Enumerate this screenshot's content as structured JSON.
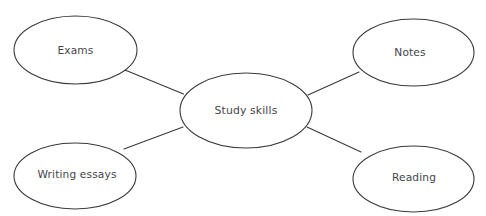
{
  "diagram": {
    "type": "mind-map",
    "background_color": "#ffffff",
    "stroke_color": "#3a3a3e",
    "text_color": "#45454a",
    "center_node": {
      "id": "study-skills",
      "label": "Study skills",
      "cx": 246,
      "cy": 110.5,
      "rx": 66,
      "ry": 37.5
    },
    "branch_nodes": [
      {
        "id": "exams",
        "label": "Exams",
        "cx": 75.5,
        "cy": 50,
        "rx": 61.5,
        "ry": 34
      },
      {
        "id": "notes",
        "label": "Notes",
        "cx": 413.5,
        "cy": 52.5,
        "rx": 60.5,
        "ry": 33.5
      },
      {
        "id": "writing-essays",
        "label": "Writing essays",
        "cx": 75,
        "cy": 176,
        "rx": 61,
        "ry": 33
      },
      {
        "id": "reading",
        "label": "Reading",
        "cx": 413.5,
        "cy": 179,
        "rx": 60.5,
        "ry": 33
      }
    ],
    "connectors": [
      {
        "id": "connector-exams",
        "from": "exams",
        "to": "study-skills",
        "x1": 125,
        "y1": 70,
        "x2": 183.5,
        "y2": 94
      },
      {
        "id": "connector-notes",
        "from": "notes",
        "to": "study-skills",
        "x1": 308,
        "y1": 95,
        "x2": 359,
        "y2": 72
      },
      {
        "id": "connector-writing-essays",
        "from": "writing-essays",
        "to": "study-skills",
        "x1": 124,
        "y1": 149,
        "x2": 183,
        "y2": 127
      },
      {
        "id": "connector-reading",
        "from": "reading",
        "to": "study-skills",
        "x1": 307,
        "y1": 127,
        "x2": 361,
        "y2": 152
      }
    ]
  }
}
